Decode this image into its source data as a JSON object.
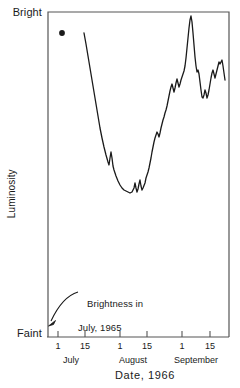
{
  "chart_data": {
    "type": "line",
    "title": "",
    "xlabel": "Date, 1966",
    "ylabel": "Luminosity",
    "ylim_labels": [
      "Faint",
      "Bright"
    ],
    "grid": false,
    "legend": "none",
    "x_tick_labels": [
      "1",
      "15",
      "1",
      "15",
      "1",
      "15"
    ],
    "x_tick_positions_px": [
      58,
      85,
      120,
      147,
      182,
      210
    ],
    "month_labels": [
      "July",
      "August",
      "September"
    ],
    "month_positions_px": [
      71,
      133,
      196
    ],
    "annotation_text_line1": "Brightness in",
    "annotation_text_line2": "July, 1965",
    "marker_point": {
      "label": "Brightness in July, 1965",
      "x_px": 62,
      "y_px": 33
    },
    "series": [
      {
        "name": "Luminosity",
        "points_px": [
          [
            84,
            33
          ],
          [
            86,
            44
          ],
          [
            88,
            56
          ],
          [
            90,
            68
          ],
          [
            92,
            80
          ],
          [
            94,
            92
          ],
          [
            96,
            104
          ],
          [
            98,
            116
          ],
          [
            100,
            128
          ],
          [
            102,
            138
          ],
          [
            104,
            147
          ],
          [
            106,
            155
          ],
          [
            108,
            162
          ],
          [
            109,
            165
          ],
          [
            110,
            158
          ],
          [
            111,
            152
          ],
          [
            112,
            158
          ],
          [
            113,
            166
          ],
          [
            114,
            170
          ],
          [
            116,
            176
          ],
          [
            118,
            181
          ],
          [
            120,
            185
          ],
          [
            122,
            188
          ],
          [
            124,
            190
          ],
          [
            126,
            191
          ],
          [
            128,
            192
          ],
          [
            130,
            193
          ],
          [
            132,
            192
          ],
          [
            134,
            188
          ],
          [
            135,
            183
          ],
          [
            136,
            188
          ],
          [
            137,
            192
          ],
          [
            138,
            189
          ],
          [
            139,
            184
          ],
          [
            140,
            180
          ],
          [
            141,
            186
          ],
          [
            142,
            190
          ],
          [
            143,
            188
          ],
          [
            145,
            183
          ],
          [
            146,
            178
          ],
          [
            147,
            175
          ],
          [
            148,
            172
          ],
          [
            149,
            168
          ],
          [
            150,
            163
          ],
          [
            151,
            158
          ],
          [
            152,
            152
          ],
          [
            153,
            147
          ],
          [
            154,
            142
          ],
          [
            155,
            138
          ],
          [
            156,
            135
          ],
          [
            157,
            132
          ],
          [
            158,
            134
          ],
          [
            159,
            137
          ],
          [
            160,
            133
          ],
          [
            161,
            128
          ],
          [
            162,
            124
          ],
          [
            163,
            120
          ],
          [
            164,
            117
          ],
          [
            165,
            113
          ],
          [
            166,
            110
          ],
          [
            167,
            106
          ],
          [
            168,
            101
          ],
          [
            169,
            96
          ],
          [
            170,
            91
          ],
          [
            171,
            87
          ],
          [
            172,
            84
          ],
          [
            173,
            88
          ],
          [
            174,
            92
          ],
          [
            175,
            88
          ],
          [
            176,
            83
          ],
          [
            177,
            79
          ],
          [
            178,
            83
          ],
          [
            179,
            87
          ],
          [
            180,
            84
          ],
          [
            181,
            80
          ],
          [
            182,
            77
          ],
          [
            183,
            74
          ],
          [
            184,
            71
          ],
          [
            185,
            66
          ],
          [
            186,
            58
          ],
          [
            187,
            48
          ],
          [
            188,
            38
          ],
          [
            189,
            28
          ],
          [
            190,
            20
          ],
          [
            191,
            16
          ],
          [
            192,
            22
          ],
          [
            193,
            33
          ],
          [
            194,
            45
          ],
          [
            195,
            57
          ],
          [
            196,
            66
          ],
          [
            197,
            72
          ],
          [
            198,
            70
          ],
          [
            199,
            74
          ],
          [
            200,
            82
          ],
          [
            201,
            90
          ],
          [
            202,
            97
          ],
          [
            203,
            98
          ],
          [
            204,
            95
          ],
          [
            205,
            90
          ],
          [
            206,
            93
          ],
          [
            207,
            98
          ],
          [
            208,
            95
          ],
          [
            209,
            90
          ],
          [
            210,
            84
          ],
          [
            211,
            78
          ],
          [
            212,
            73
          ],
          [
            213,
            70
          ],
          [
            214,
            74
          ],
          [
            215,
            78
          ],
          [
            216,
            74
          ],
          [
            217,
            70
          ],
          [
            218,
            66
          ],
          [
            219,
            62
          ],
          [
            220,
            64
          ],
          [
            221,
            62
          ],
          [
            222,
            60
          ],
          [
            223,
            66
          ],
          [
            224,
            73
          ],
          [
            225,
            80
          ]
        ]
      }
    ]
  },
  "axis": {
    "bright_label": "Bright",
    "faint_label": "Faint",
    "y_axis_title": "Luminosity",
    "x_axis_title": "Date, 1966"
  },
  "annotation": {
    "line1": "Brightness in",
    "line2": "July, 1965"
  },
  "colors": {
    "line": "#1a1a1a",
    "axis": "#4a4a4a",
    "text": "#1a1a1a",
    "background": "#ffffff"
  }
}
